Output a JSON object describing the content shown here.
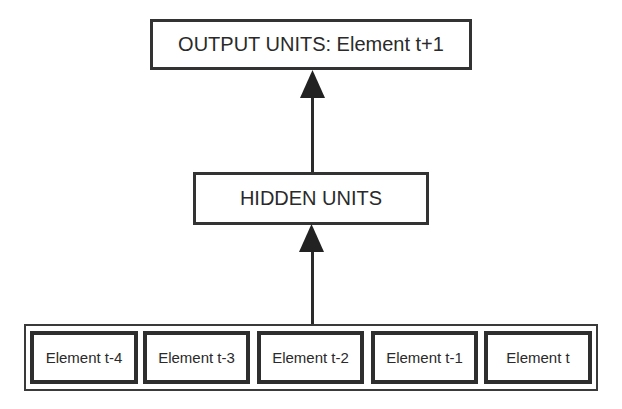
{
  "diagram": {
    "output_box": {
      "label": "OUTPUT UNITS: Element t+1"
    },
    "hidden_box": {
      "label": "HIDDEN UNITS"
    },
    "input_group": {
      "elements": [
        {
          "label": "Element t-4"
        },
        {
          "label": "Element t-3"
        },
        {
          "label": "Element t-2"
        },
        {
          "label": "Element t-1"
        },
        {
          "label": "Element t"
        }
      ]
    },
    "arrows": [
      {
        "from": "input_group",
        "to": "hidden_box"
      },
      {
        "from": "hidden_box",
        "to": "output_box"
      }
    ],
    "colors": {
      "stroke": "#333333",
      "background": "#ffffff"
    }
  }
}
